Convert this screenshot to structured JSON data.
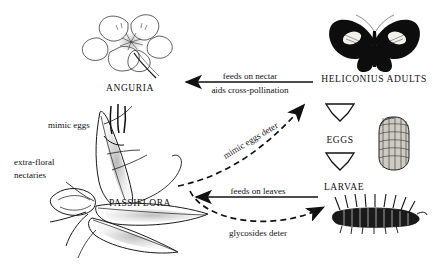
{
  "figure": {
    "type": "ecological-interaction-diagram",
    "background_color": "#ffffff",
    "ink_color": "#111111"
  },
  "nodes": {
    "anguria": {
      "label": "ANGURIA",
      "illustration": "flower-icon",
      "x": 130,
      "y": 88
    },
    "passiflora": {
      "label": "PASSIFLORA",
      "illustration": "passionflower-vine-icon",
      "x": 140,
      "y": 203
    },
    "heliconius_adults": {
      "label": "HELICONIUS ADULTS",
      "illustration": "butterfly-icon",
      "x": 374,
      "y": 79
    },
    "eggs": {
      "label": "EGGS",
      "illustration": "butterfly-egg-icon",
      "x": 340,
      "y": 140
    },
    "larvae": {
      "label": "LARVAE",
      "illustration": "caterpillar-icon",
      "x": 344,
      "y": 187
    }
  },
  "annotations": {
    "mimic_eggs": "mimic eggs",
    "extra_floral_nectaries_line1": "extra-floral",
    "extra_floral_nectaries_line2": "nectaries"
  },
  "edges": [
    {
      "id": "adults-to-anguria",
      "label_line1": "feeds on nectar",
      "label_line2": "aids cross-pollination",
      "style": "solid",
      "direction": "left",
      "from": "heliconius_adults",
      "to": "anguria"
    },
    {
      "id": "passiflora-deters-adults",
      "label": "mimic eggs deter",
      "style": "dashed",
      "direction": "up-right",
      "from": "passiflora",
      "to": "heliconius_adults"
    },
    {
      "id": "larvae-feed-passiflora",
      "label": "feeds on leaves",
      "style": "solid",
      "direction": "left",
      "from": "larvae",
      "to": "passiflora"
    },
    {
      "id": "passiflora-deters-larvae",
      "label": "glycosides deter",
      "style": "dashed",
      "direction": "right",
      "from": "passiflora",
      "to": "larvae"
    },
    {
      "id": "adults-to-eggs",
      "label": "",
      "style": "hollow-chevron",
      "direction": "down",
      "from": "heliconius_adults",
      "to": "eggs"
    },
    {
      "id": "eggs-to-larvae",
      "label": "",
      "style": "hollow-chevron",
      "direction": "down",
      "from": "eggs",
      "to": "larvae"
    }
  ]
}
